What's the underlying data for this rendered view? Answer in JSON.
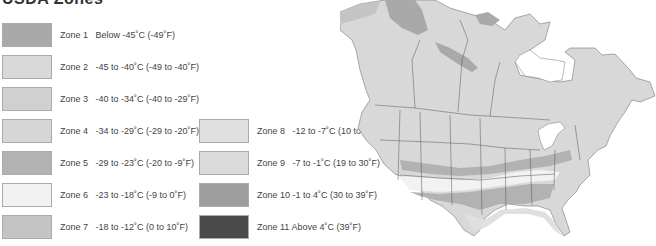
{
  "title": "USDA Zones",
  "legend": [
    {
      "zone": "Zone 1",
      "range": "Below -45˚C (-49˚F)",
      "color": "#a9a9a9"
    },
    {
      "zone": "Zone 2",
      "range": "-45 to -40˚C (-49 to -40˚F)",
      "color": "#d9d9d9"
    },
    {
      "zone": "Zone 3",
      "range": "-40 to -34˚C (-40 to -29˚F)",
      "color": "#d0d0d0"
    },
    {
      "zone": "Zone 4",
      "range": "-34 to -29˚C (-29 to -20˚F)",
      "color": "#d6d6d6"
    },
    {
      "zone": "Zone 5",
      "range": "-29 to -23˚C (-20 to -9˚F)",
      "color": "#b2b2b2"
    },
    {
      "zone": "Zone 6",
      "range": "-23 to -18˚C (-9 to 0˚F)",
      "color": "#f2f2f2"
    },
    {
      "zone": "Zone 7",
      "range": "-18 to -12˚C (0 to 10˚F)",
      "color": "#c4c4c4"
    },
    {
      "zone": "Zone 8",
      "range": "-12 to -7˚C (10 to 19˚F)",
      "color": "#e0e0e0"
    },
    {
      "zone": "Zone 9",
      "range": "-7 to -1˚C (19 to 30˚F)",
      "color": "#dadada"
    },
    {
      "zone": "Zone 10",
      "range": "-1 to 4˚C (30 to 39˚F)",
      "color": "#9e9e9e"
    },
    {
      "zone": "Zone 11",
      "range": "Above 4˚C (39˚F)",
      "color": "#4a4a4a"
    }
  ],
  "map": {
    "region": "North America hardiness zone map",
    "land_color": "#d8d8d8",
    "border_color": "#555555"
  }
}
